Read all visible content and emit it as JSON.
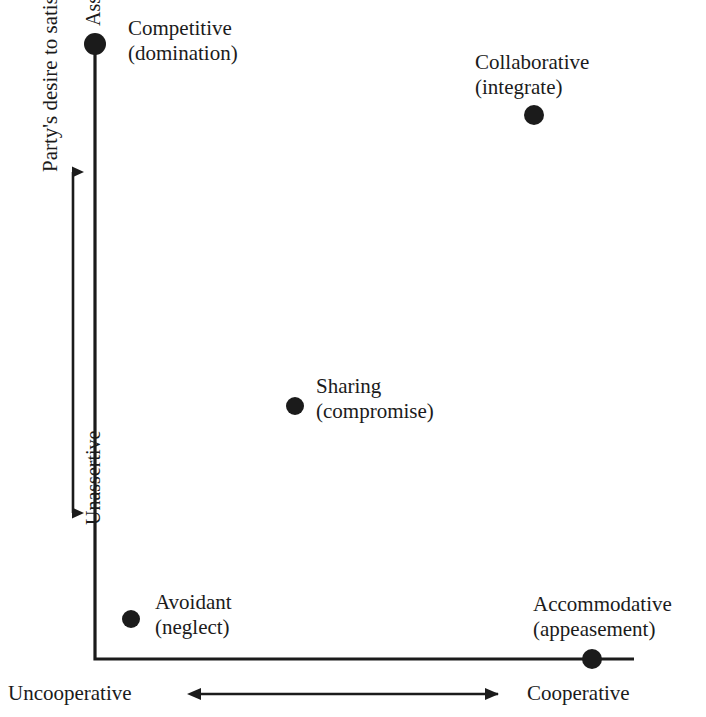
{
  "figure": {
    "type": "scatter",
    "background": "#ffffff",
    "ink_color": "#1b1b1b",
    "width": 706,
    "height": 717
  },
  "axes": {
    "y": {
      "title": "Party's desire to satisfy own concern",
      "high_tick": "Assertive",
      "low_tick": "Unassertive",
      "arrow": "double-headed-vertical"
    },
    "x": {
      "low_end": "Uncooperative",
      "high_end": "Cooperative",
      "arrow": "double-headed-horizontal"
    }
  },
  "points": [
    {
      "name": "competitive",
      "line1": "Competitive",
      "line2": "(domination)",
      "cx": 95,
      "cy": 44,
      "r": 11,
      "label_x": 128,
      "label_y": 16
    },
    {
      "name": "collaborative",
      "line1": "Collaborative",
      "line2": "(integrate)",
      "cx": 534,
      "cy": 115,
      "r": 10,
      "label_x": 475,
      "label_y": 50
    },
    {
      "name": "sharing",
      "line1": "Sharing",
      "line2": "(compromise)",
      "cx": 295,
      "cy": 406,
      "r": 9,
      "label_x": 316,
      "label_y": 374
    },
    {
      "name": "avoidant",
      "line1": "Avoidant",
      "line2": "(neglect)",
      "cx": 131,
      "cy": 619,
      "r": 9,
      "label_x": 155,
      "label_y": 590
    },
    {
      "name": "accommodative",
      "line1": "Accommodative",
      "line2": "(appeasement)",
      "cx": 592,
      "cy": 659,
      "r": 10,
      "label_x": 533,
      "label_y": 592
    }
  ],
  "chart_data": {
    "type": "scatter",
    "title": "",
    "xlabel": "Uncooperative ↔ Cooperative",
    "ylabel": "Party's desire to satisfy own concern",
    "xlim": [
      0,
      100
    ],
    "ylim": [
      0,
      100
    ],
    "xticklabels": [
      "Uncooperative",
      "Cooperative"
    ],
    "yticklabels": [
      "Unassertive",
      "Assertive"
    ],
    "grid": false,
    "legend": "none",
    "marker": "filled-circle",
    "marker_color": "#1b1b1b",
    "points": [
      {
        "label": "Competitive (domination)",
        "x": 0,
        "y": 100
      },
      {
        "label": "Collaborative (integrate)",
        "x": 88,
        "y": 88
      },
      {
        "label": "Sharing (compromise)",
        "x": 40,
        "y": 41
      },
      {
        "label": "Avoidant (neglect)",
        "x": 7,
        "y": 6
      },
      {
        "label": "Accommodative (appeasement)",
        "x": 100,
        "y": 0
      }
    ],
    "annotations": [
      "Competitive\n(domination)",
      "Collaborative\n(integrate)",
      "Sharing\n(compromise)",
      "Avoidant\n(neglect)",
      "Accommodative\n(appeasement)"
    ]
  }
}
